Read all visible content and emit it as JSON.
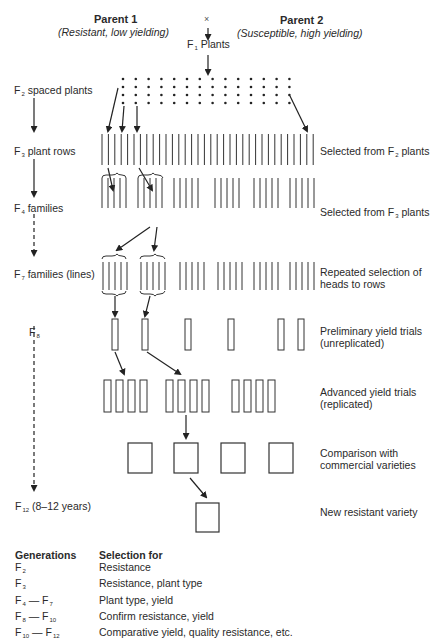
{
  "header": {
    "cross_symbol": "×",
    "parent1": {
      "title": "Parent 1",
      "subtitle": "(Resistant, low yielding)"
    },
    "parent2": {
      "title": "Parent 2",
      "subtitle": "(Susceptible, high yielding)"
    },
    "f1": {
      "prefix": "F",
      "sub": "1",
      "label": "Plants"
    }
  },
  "generations": [
    {
      "id": "f2",
      "prefix": "F",
      "sub": "2",
      "label": "spaced plants"
    },
    {
      "id": "f3",
      "prefix": "F",
      "sub": "3",
      "label": "plant rows"
    },
    {
      "id": "f4",
      "prefix": "F",
      "sub": "4",
      "label": "families"
    },
    {
      "id": "f7",
      "prefix": "F",
      "sub": "7",
      "label": "families (lines)"
    },
    {
      "id": "f8",
      "prefix": "F",
      "sub": "8",
      "label": ""
    },
    {
      "id": "f12",
      "prefix": "F",
      "sub": "12",
      "label": "(8–12 years)"
    }
  ],
  "stage_notes": [
    {
      "id": "f3",
      "line1": "Selected from F",
      "sub": "2",
      "line1_end": " plants",
      "line2": ""
    },
    {
      "id": "f4",
      "line1": "Selected from F",
      "sub": "3",
      "line1_end": " plants",
      "line2": ""
    },
    {
      "id": "f7",
      "line1": "Repeated selection of",
      "sub": "",
      "line1_end": "",
      "line2": "heads to rows"
    },
    {
      "id": "f8",
      "line1": "Preliminary yield trials",
      "sub": "",
      "line1_end": "",
      "line2": "(unreplicated)"
    },
    {
      "id": "adv",
      "line1": "Advanced yield trials",
      "sub": "",
      "line1_end": "",
      "line2": "(replicated)"
    },
    {
      "id": "comp",
      "line1": "Comparison with",
      "sub": "",
      "line1_end": "",
      "line2": "commercial varieties"
    },
    {
      "id": "new",
      "line1": "New resistant variety",
      "sub": "",
      "line1_end": "",
      "line2": ""
    }
  ],
  "legend": {
    "col1_header": "Generations",
    "col2_header": "Selection for",
    "rows": [
      {
        "gen_a": "F",
        "sub_a": "2",
        "dash": "",
        "gen_b": "",
        "sub_b": "",
        "selection": "Resistance"
      },
      {
        "gen_a": "F",
        "sub_a": "3",
        "dash": "",
        "gen_b": "",
        "sub_b": "",
        "selection": "Resistance, plant type"
      },
      {
        "gen_a": "F",
        "sub_a": "4",
        "dash": " — ",
        "gen_b": "F",
        "sub_b": "7",
        "selection": "Plant type, yield"
      },
      {
        "gen_a": "F",
        "sub_a": "8",
        "dash": " — ",
        "gen_b": "F",
        "sub_b": "10",
        "selection": "Confirm resistance, yield"
      },
      {
        "gen_a": "F",
        "sub_a": "10",
        "dash": " — ",
        "gen_b": "F",
        "sub_b": "12",
        "selection": "Comparative yield, quality resistance, etc."
      }
    ]
  },
  "colors": {
    "ink": "#222222",
    "background": "#ffffff"
  }
}
